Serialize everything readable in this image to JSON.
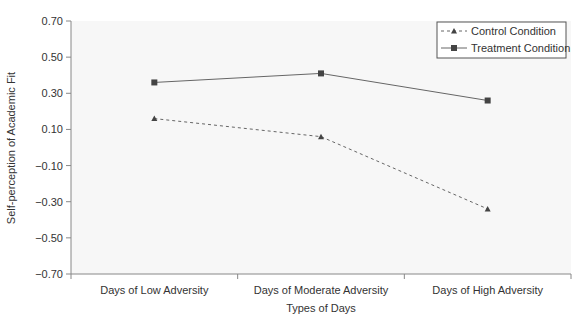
{
  "chart_data": {
    "type": "line",
    "title": "",
    "xlabel": "Types of Days",
    "ylabel": "Self-perception of Academic Fit",
    "categories": [
      "Days of Low Adversity",
      "Days of Moderate Adversity",
      "Days of High Adversity"
    ],
    "ylim": [
      -0.7,
      0.7
    ],
    "yticks": [
      "0.70",
      "0.50",
      "0.30",
      "0.10",
      "-0.10",
      "-0.30",
      "-0.50",
      "-0.70"
    ],
    "grid": false,
    "legend_position": "upper right",
    "series": [
      {
        "name": "Control Condition",
        "marker": "triangle",
        "line": "dashed",
        "values": [
          0.16,
          0.06,
          -0.34
        ]
      },
      {
        "name": "Treatment Condition",
        "marker": "square",
        "line": "solid",
        "values": [
          0.36,
          0.41,
          0.26
        ]
      }
    ]
  }
}
